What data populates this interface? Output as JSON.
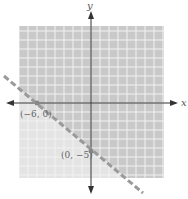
{
  "chart_data": {
    "type": "line",
    "title": "",
    "xlabel": "x",
    "ylabel": "y",
    "xlim": [
      -8,
      8
    ],
    "ylim": [
      -8,
      8
    ],
    "grid": true,
    "boundary": {
      "style": "dashed",
      "slope": -0.8333,
      "intercept": -5,
      "equation": "5x + 6y = -30"
    },
    "shaded_region": "above",
    "points": [
      {
        "x": -6,
        "y": 0,
        "label": "(−6, 0)"
      },
      {
        "x": 0,
        "y": -5,
        "label": "(0, −5)"
      }
    ],
    "colors": {
      "shade": "#c8c8c8",
      "unshaded": "#e6e6e6",
      "grid": "#f4f4f4",
      "line": "#9a9a9a",
      "axis": "#333333"
    }
  },
  "labels": {
    "x_axis": "x",
    "y_axis": "y",
    "point1": "(−6, 0)",
    "point2": "(0, −5)"
  }
}
